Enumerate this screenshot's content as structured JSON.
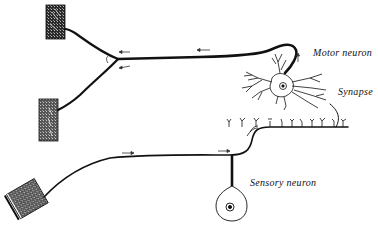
{
  "diagram": {
    "type": "reflex-arc",
    "labels": {
      "motor_neuron": "Motor neuron",
      "synapse": "Synapse",
      "sensory_neuron": "Sensory neuron"
    },
    "colors": {
      "ink": "#111111",
      "background": "#ffffff",
      "muscle_fill": "#3a3a3a"
    },
    "elements": [
      {
        "name": "muscle-upper",
        "kind": "effector"
      },
      {
        "name": "muscle-middle",
        "kind": "effector"
      },
      {
        "name": "receptor-skin",
        "kind": "receptor"
      },
      {
        "name": "motor-neuron-cell-body",
        "kind": "neuron"
      },
      {
        "name": "sensory-neuron-cell-body",
        "kind": "neuron"
      },
      {
        "name": "synapse",
        "kind": "junction"
      }
    ]
  }
}
